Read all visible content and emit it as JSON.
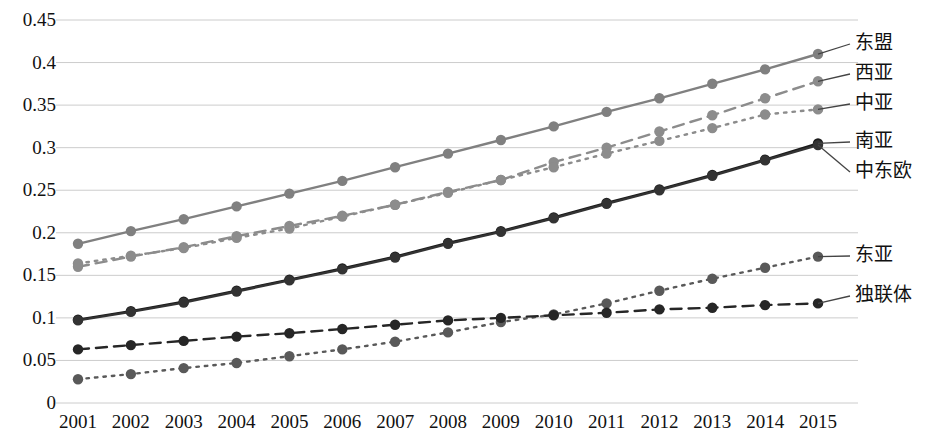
{
  "chart_data": {
    "type": "line",
    "title": "",
    "subtitle": "",
    "xlabel": "",
    "ylabel": "",
    "categories": [
      "2001",
      "2002",
      "2003",
      "2004",
      "2005",
      "2006",
      "2007",
      "2008",
      "2009",
      "2010",
      "2011",
      "2012",
      "2013",
      "2014",
      "2015"
    ],
    "x_tick_labels": [
      "2001",
      "2002",
      "2003",
      "2004",
      "2005",
      "2006",
      "2007",
      "2008",
      "2009",
      "2010",
      "2011",
      "2012",
      "2013",
      "2014",
      "2015"
    ],
    "y_tick_labels": [
      "0.45",
      "0.4",
      "0.35",
      "0.3",
      "0.25",
      "0.2",
      "0.15",
      "0.1",
      "0.05",
      "0"
    ],
    "y_tick_values": [
      0.45,
      0.4,
      0.35,
      0.3,
      0.25,
      0.2,
      0.15,
      0.1,
      0.05,
      0
    ],
    "ylim": [
      0,
      0.45
    ],
    "grid": "horizontal",
    "legend_position": "right-inline",
    "series": [
      {
        "name": "东盟",
        "color": "#808080",
        "line_style": "solid",
        "marker": "circle",
        "values": [
          0.187,
          0.202,
          0.216,
          0.231,
          0.246,
          0.261,
          0.277,
          0.293,
          0.309,
          0.325,
          0.342,
          0.358,
          0.375,
          0.392,
          0.41
        ]
      },
      {
        "name": "西亚",
        "color": "#8c8c8c",
        "line_style": "dashed",
        "marker": "circle",
        "values": [
          0.16,
          0.172,
          0.183,
          0.196,
          0.208,
          0.22,
          0.233,
          0.248,
          0.262,
          0.283,
          0.3,
          0.319,
          0.338,
          0.358,
          0.378
        ]
      },
      {
        "name": "中亚",
        "color": "#8c8c8c",
        "line_style": "dotted",
        "marker": "circle",
        "values": [
          0.164,
          0.173,
          0.182,
          0.194,
          0.205,
          0.219,
          0.233,
          0.247,
          0.262,
          0.277,
          0.293,
          0.308,
          0.323,
          0.339,
          0.345
        ]
      },
      {
        "name": "南亚",
        "color": "#1a1a1a",
        "line_style": "solid",
        "marker": "circle",
        "values": [
          0.098,
          0.108,
          0.119,
          0.132,
          0.145,
          0.158,
          0.172,
          0.188,
          0.202,
          0.218,
          0.235,
          0.251,
          0.268,
          0.286,
          0.305
        ]
      },
      {
        "name": "中东欧",
        "color": "#333333",
        "line_style": "solid",
        "marker": "circle",
        "values": [
          0.097,
          0.107,
          0.118,
          0.131,
          0.144,
          0.157,
          0.171,
          0.187,
          0.201,
          0.217,
          0.234,
          0.25,
          0.267,
          0.285,
          0.303
        ]
      },
      {
        "name": "东亚",
        "color": "#595959",
        "line_style": "dotted",
        "marker": "circle",
        "values": [
          0.028,
          0.034,
          0.041,
          0.047,
          0.055,
          0.063,
          0.072,
          0.083,
          0.095,
          0.104,
          0.117,
          0.132,
          0.146,
          0.159,
          0.172
        ]
      },
      {
        "name": "独联体",
        "color": "#262626",
        "line_style": "dashed",
        "marker": "circle",
        "values": [
          0.063,
          0.068,
          0.073,
          0.078,
          0.082,
          0.087,
          0.092,
          0.097,
          0.1,
          0.103,
          0.106,
          0.11,
          0.112,
          0.115,
          0.117
        ]
      }
    ],
    "legend_callouts": [
      {
        "name": "东盟",
        "series_index": 0,
        "anchor_year": "2015"
      },
      {
        "name": "西亚",
        "series_index": 1,
        "anchor_year": "2015"
      },
      {
        "name": "中亚",
        "series_index": 2,
        "anchor_year": "2015"
      },
      {
        "name": "南亚",
        "series_index": 3,
        "anchor_year": "2015"
      },
      {
        "name": "中东欧",
        "series_index": 4,
        "anchor_year": "2015"
      },
      {
        "name": "东亚",
        "series_index": 5,
        "anchor_year": "2015"
      },
      {
        "name": "独联体",
        "series_index": 6,
        "anchor_year": "2015"
      }
    ]
  },
  "colors": {
    "grid": "#cccccc",
    "text": "#111111",
    "background": "#ffffff"
  }
}
